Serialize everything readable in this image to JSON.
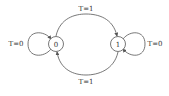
{
  "diagram": {
    "type": "state-transition",
    "states": [
      {
        "id": "s0",
        "label": "0"
      },
      {
        "id": "s1",
        "label": "1"
      }
    ],
    "transitions": [
      {
        "from": "0",
        "to": "1",
        "label": "T=1"
      },
      {
        "from": "1",
        "to": "0",
        "label": "T=1"
      },
      {
        "from": "0",
        "to": "0",
        "label": "T=0"
      },
      {
        "from": "1",
        "to": "1",
        "label": "T=0"
      }
    ],
    "colors": {
      "stroke": "#555555",
      "text": "#333333",
      "background": "#ffffff"
    }
  }
}
